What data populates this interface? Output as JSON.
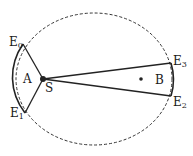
{
  "diagram": {
    "colors": {
      "stroke": "#222222",
      "background": "#ffffff"
    },
    "ellipse": {
      "cx": 94,
      "cy": 79,
      "rx": 78,
      "ry": 66,
      "style": "dashed"
    },
    "sun": {
      "label": "S",
      "x": 43,
      "y": 79
    },
    "focus_dot": {
      "x": 141,
      "y": 79
    },
    "points": {
      "E0": {
        "label": "E",
        "sub": "0",
        "x": 23,
        "y": 44
      },
      "E1": {
        "label": "E",
        "sub": "1",
        "x": 25,
        "y": 113
      },
      "E2": {
        "label": "E",
        "sub": "2",
        "x": 171,
        "y": 96
      },
      "E3": {
        "label": "E",
        "sub": "3",
        "x": 171,
        "y": 63
      }
    },
    "areas": {
      "A": {
        "label": "A"
      },
      "B": {
        "label": "B"
      }
    }
  }
}
